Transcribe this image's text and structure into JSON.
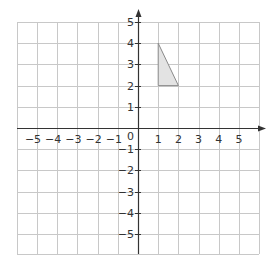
{
  "diagram": {
    "type": "coordinate-grid",
    "x_axis": {
      "ticks": [
        -5,
        -4,
        -3,
        -2,
        -1,
        1,
        2,
        3,
        4,
        5
      ],
      "labels": [
        "−5",
        "−4",
        "−3",
        "−2",
        "−1",
        "1",
        "2",
        "3",
        "4",
        "5"
      ]
    },
    "y_axis": {
      "ticks": [
        5,
        4,
        3,
        2,
        1,
        -1,
        -2,
        -3,
        -4,
        -5
      ],
      "labels": [
        "5",
        "4",
        "3",
        "2",
        "1",
        "−1",
        "−2",
        "−3",
        "−4",
        "−5"
      ]
    },
    "origin_label": "0",
    "shape": {
      "name": "triangle",
      "vertices": [
        [
          1,
          4
        ],
        [
          1,
          2
        ],
        [
          2,
          2
        ]
      ],
      "fill": "#e3e3e3",
      "stroke": "#8a8a8a"
    },
    "colors": {
      "grid": "#c8c8c8",
      "axis": "#333333"
    }
  }
}
